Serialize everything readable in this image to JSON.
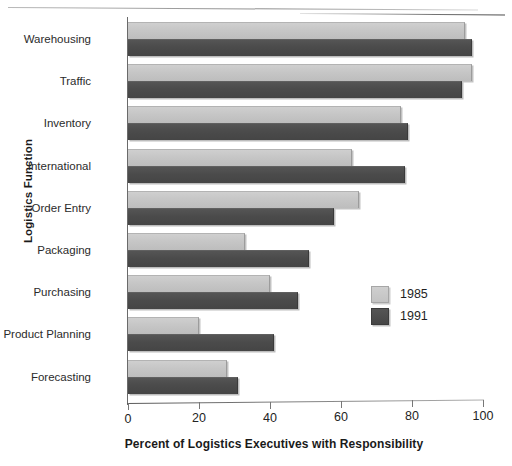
{
  "chart_data": {
    "type": "bar",
    "orientation": "horizontal",
    "title": "",
    "xlabel": "Percent of Logistics Executives with Responsibility",
    "ylabel": "Logistics Function",
    "xlim": [
      0,
      100
    ],
    "xticks": [
      0,
      20,
      40,
      60,
      80,
      100
    ],
    "grid": false,
    "legend_position": "center-right",
    "categories": [
      "Warehousing",
      "Traffic",
      "Inventory",
      "International",
      "Order Entry",
      "Packaging",
      "Purchasing",
      "Product Planning",
      "Forecasting"
    ],
    "series": [
      {
        "name": "1985",
        "color": "#C6C6C6",
        "values": [
          95,
          97,
          77,
          63,
          65,
          33,
          40,
          20,
          28
        ]
      },
      {
        "name": "1991",
        "color": "#4B4B4B",
        "values": [
          97,
          94,
          79,
          78,
          58,
          51,
          48,
          41,
          31
        ]
      }
    ]
  },
  "legend": {
    "entries": [
      {
        "label": "1985"
      },
      {
        "label": "1991"
      }
    ]
  }
}
